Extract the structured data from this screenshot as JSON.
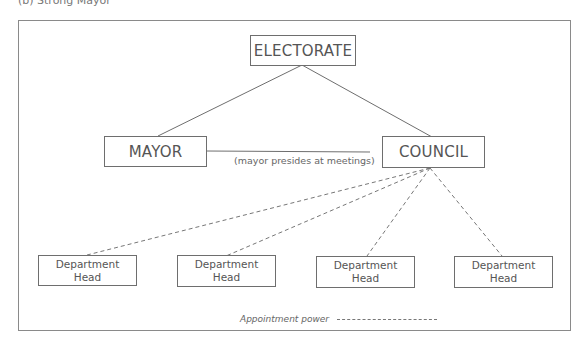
{
  "caption": "(b) Strong Mayor",
  "nodes": {
    "electorate": "ELECTORATE",
    "mayor": "MAYOR",
    "council": "COUNCIL",
    "departments": [
      {
        "line1": "Department",
        "line2": "Head"
      },
      {
        "line1": "Department",
        "line2": "Head"
      },
      {
        "line1": "Department",
        "line2": "Head"
      },
      {
        "line1": "Department",
        "line2": "Head"
      }
    ]
  },
  "mayor_council_link_label": "(mayor presides at meetings)",
  "legend": {
    "label": "Appointment power",
    "line_style": "dashed"
  },
  "colors": {
    "line": "#6e6e6e",
    "text": "#555555",
    "background": "#ffffff"
  }
}
